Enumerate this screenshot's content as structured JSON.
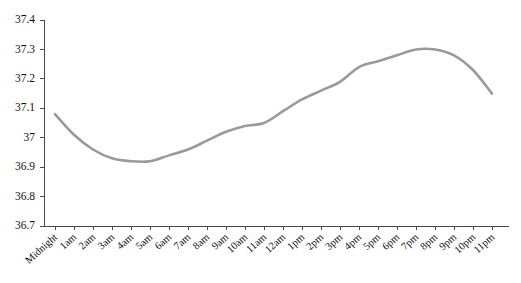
{
  "chart_data": {
    "type": "line",
    "title": "",
    "subtitle": "",
    "xlabel": "",
    "ylabel": "",
    "grid": false,
    "legend": "none",
    "line_color": "#9a9a9a",
    "axis_color": "#4a4a4a",
    "background_color": "#ffffff",
    "ylim": [
      36.7,
      37.4
    ],
    "yticks": [
      36.7,
      36.8,
      36.9,
      37,
      37.1,
      37.2,
      37.3,
      37.4
    ],
    "ytick_labels": [
      "36.7",
      "36.8",
      "36.9",
      "37",
      "37.1",
      "37.2",
      "37.3",
      "37.4"
    ],
    "categories": [
      "Midnight",
      "1am",
      "2am",
      "3am",
      "4am",
      "5am",
      "6am",
      "7am",
      "8am",
      "9am",
      "10am",
      "11am",
      "12am",
      "1pm",
      "2pm",
      "3pm",
      "4pm",
      "5pm",
      "6pm",
      "7pm",
      "8pm",
      "9pm",
      "10pm",
      "11pm"
    ],
    "values": [
      37.08,
      37.01,
      36.96,
      36.93,
      36.92,
      36.92,
      36.94,
      36.96,
      36.99,
      37.02,
      37.04,
      37.05,
      37.09,
      37.13,
      37.16,
      37.19,
      37.24,
      37.26,
      37.28,
      37.3,
      37.3,
      37.28,
      37.23,
      37.15
    ]
  }
}
